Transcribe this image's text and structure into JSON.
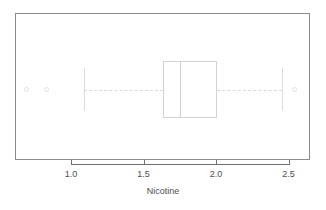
{
  "chart_data": {
    "type": "box",
    "orientation": "horizontal",
    "title": "",
    "xlabel": "Nicotine",
    "ylabel": "",
    "xlim": [
      0.62,
      2.65
    ],
    "grid": false,
    "legend": null,
    "xticks": [
      {
        "value": 1.0,
        "label": "1.0"
      },
      {
        "value": 1.5,
        "label": "1.5"
      },
      {
        "value": 2.0,
        "label": "2.0"
      },
      {
        "value": 2.5,
        "label": "2.5"
      }
    ],
    "boxes": [
      {
        "name": "Nicotine",
        "min_whisker": 1.09,
        "q1": 1.634,
        "median": 1.751,
        "q3": 2.005,
        "max_whisker": 2.453,
        "outliers": [
          0.69,
          0.828,
          2.543
        ]
      }
    ]
  },
  "axis": {
    "tick_labels": [
      "1.0",
      "1.5",
      "2.0",
      "2.5"
    ],
    "title": "Nicotine"
  },
  "colors": {
    "frame": "#8c8c8c",
    "axis": "#6f6f6f",
    "box_outline": "#d3d3d3",
    "median": "#d0d0d0",
    "whisker": "#dadada",
    "outlier": "#e2e2e2",
    "text": "#4d4d4d",
    "background": "#ffffff"
  }
}
